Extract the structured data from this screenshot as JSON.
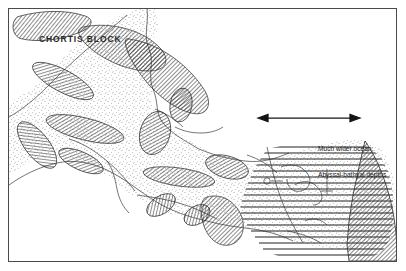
{
  "figure": {
    "kind": "paleogeographic-map",
    "frame": {
      "border_color": "#4a4a4a",
      "background": "#ffffff"
    }
  },
  "labels": {
    "chortis_block": "CHORTIS BLOCK",
    "ocean_line_1": "Much wider ocean;",
    "ocean_line_2": "Abyssal-bathyal depths"
  },
  "annotations": {
    "extent_arrow": {
      "name": "double-headed-extent-arrow",
      "x_start": 258,
      "x_end": 356,
      "y": 117,
      "color": "#141414"
    }
  },
  "legend_semantics": {
    "hatched_diagonal": "fault-bounded basement block",
    "stipple": "shallow shelf / coastal clastic belt",
    "horizontal_lines": "abyssal-bathyal ocean floor",
    "thin_lines": "coastline and structural lineaments"
  },
  "colors": {
    "ink": "#1a1a1a",
    "hatch": "#2e2e2e",
    "stipple": "#555555",
    "ocean_lines": "#232323",
    "frame": "#4a4a4a"
  },
  "geometry": {
    "blocks_count": 14,
    "ocean_line_count": 18
  }
}
